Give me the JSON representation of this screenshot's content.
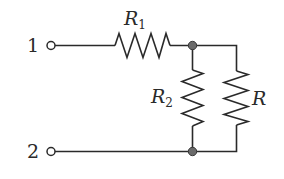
{
  "diagram": {
    "type": "circuit-schematic",
    "colors": {
      "line": "#2a2a2a",
      "node_fill": "#6a6a6a",
      "background": "#ffffff"
    },
    "terminals": [
      {
        "id": "t1",
        "label": "1"
      },
      {
        "id": "t2",
        "label": "2"
      }
    ],
    "resistors": [
      {
        "id": "r1",
        "name": "R",
        "subscript": "1",
        "connection": "series, between terminal 1 and top node"
      },
      {
        "id": "r2",
        "name": "R",
        "subscript": "2",
        "connection": "parallel branch between top node and bottom node"
      },
      {
        "id": "r",
        "name": "R",
        "subscript": "",
        "connection": "parallel branch between top node and bottom node"
      }
    ],
    "nodes": [
      {
        "id": "top-node"
      },
      {
        "id": "bottom-node"
      }
    ]
  }
}
